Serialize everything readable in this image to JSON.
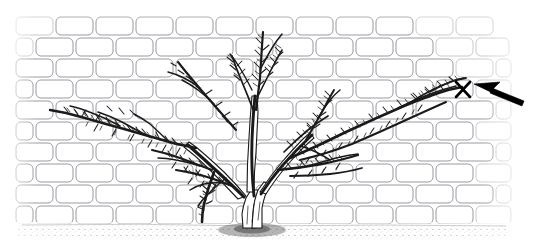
{
  "scene": {
    "title": "Pruning diagram: wall-trained shrub with removal mark",
    "background_color": "#ffffff",
    "width": 537,
    "height": 252
  },
  "wall": {
    "name": "brick wall backdrop",
    "mortar_color": "#ffffff",
    "brick_outline_color": "#8d8f95",
    "brick_outline_faint_color": "#b9bbc0",
    "brick_width": 40,
    "brick_height": 20,
    "bond_pattern": "running bond",
    "left_edge": 15,
    "right_edge": 517,
    "top_edge": 16,
    "bottom_edge": 225,
    "row_count": 10,
    "row_y": [
      16,
      37,
      58,
      79,
      100,
      121,
      142,
      163,
      184,
      205
    ],
    "row_offsets": [
      0,
      20,
      0,
      20,
      0,
      20,
      0,
      20,
      0,
      20
    ]
  },
  "ground": {
    "name": "stippled soil band",
    "color": "#6e6e6e",
    "top": 224,
    "height": 18
  },
  "plant": {
    "name": "wall-trained shrub",
    "branch_color": "#1a1a1a",
    "trunk_base_x": 252,
    "trunk_base_y": 226,
    "canopy_top_y": 24,
    "canopy_left_x": 46,
    "canopy_right_x": 466
  },
  "annotation": {
    "mark_label": "X",
    "mark_meaning": "cut-here mark",
    "mark_x": 463,
    "mark_y": 89,
    "mark_color": "#000000",
    "arrow_color": "#000000",
    "arrow_tip_x": 474,
    "arrow_tip_y": 84,
    "arrow_tail_x": 522,
    "arrow_tail_y": 104
  }
}
